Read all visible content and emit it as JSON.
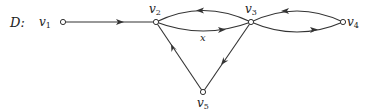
{
  "diagram": {
    "name": "D",
    "name_label": "D:",
    "nodes": [
      {
        "id": "v1",
        "base": "v",
        "sub": "1",
        "x": 63,
        "y": 22
      },
      {
        "id": "v2",
        "base": "v",
        "sub": "2",
        "x": 156,
        "y": 22
      },
      {
        "id": "v3",
        "base": "v",
        "sub": "3",
        "x": 251,
        "y": 22
      },
      {
        "id": "v4",
        "base": "v",
        "sub": "4",
        "x": 343,
        "y": 22
      },
      {
        "id": "v5",
        "base": "v",
        "sub": "5",
        "x": 203,
        "y": 92
      }
    ],
    "edges": [
      {
        "from": "v1",
        "to": "v2",
        "label": ""
      },
      {
        "from": "v3",
        "to": "v2",
        "label": ""
      },
      {
        "from": "v2",
        "to": "v3",
        "label": "x"
      },
      {
        "from": "v4",
        "to": "v3",
        "label": ""
      },
      {
        "from": "v3",
        "to": "v4",
        "label": ""
      },
      {
        "from": "v3",
        "to": "v5",
        "label": ""
      },
      {
        "from": "v5",
        "to": "v2",
        "label": ""
      }
    ],
    "edge_label_x": "x"
  }
}
